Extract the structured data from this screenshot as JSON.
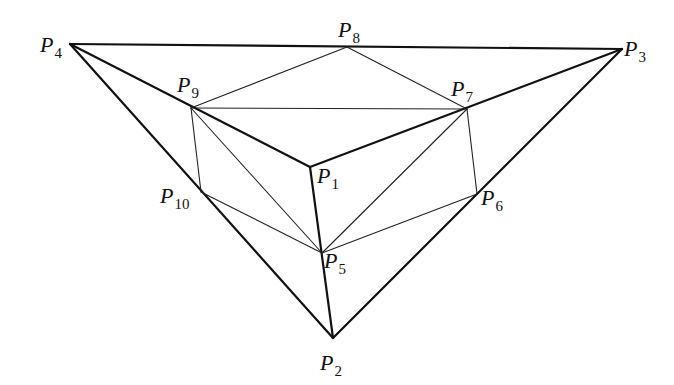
{
  "diagram": {
    "points": [
      {
        "id": "P1",
        "base": "P",
        "sub": "1",
        "x": 310,
        "y": 167,
        "lx": 317,
        "ly": 183
      },
      {
        "id": "P2",
        "base": "P",
        "sub": "2",
        "x": 333,
        "y": 338,
        "lx": 320,
        "ly": 370
      },
      {
        "id": "P3",
        "base": "P",
        "sub": "3",
        "x": 622,
        "y": 49,
        "lx": 624,
        "ly": 56
      },
      {
        "id": "P4",
        "base": "P",
        "sub": "4",
        "x": 70,
        "y": 44,
        "lx": 40,
        "ly": 52
      },
      {
        "id": "P5",
        "base": "P",
        "sub": "5",
        "x": 322,
        "y": 253,
        "lx": 324,
        "ly": 268
      },
      {
        "id": "P6",
        "base": "P",
        "sub": "6",
        "x": 477,
        "y": 194,
        "lx": 481,
        "ly": 205
      },
      {
        "id": "P7",
        "base": "P",
        "sub": "7",
        "x": 467,
        "y": 109,
        "lx": 451,
        "ly": 96
      },
      {
        "id": "P8",
        "base": "P",
        "sub": "8",
        "x": 347,
        "y": 47,
        "lx": 338,
        "ly": 37
      },
      {
        "id": "P9",
        "base": "P",
        "sub": "9",
        "x": 191,
        "y": 108,
        "lx": 177,
        "ly": 92
      },
      {
        "id": "P10",
        "base": "P",
        "sub": "10",
        "x": 201,
        "y": 192,
        "lx": 160,
        "ly": 203
      }
    ],
    "thick_edges": [
      [
        "P4",
        "P3"
      ],
      [
        "P4",
        "P2"
      ],
      [
        "P3",
        "P2"
      ],
      [
        "P4",
        "P1"
      ],
      [
        "P3",
        "P1"
      ],
      [
        "P1",
        "P2"
      ]
    ],
    "thin_edges": [
      [
        "P9",
        "P8"
      ],
      [
        "P8",
        "P7"
      ],
      [
        "P9",
        "P7"
      ],
      [
        "P9",
        "P10"
      ],
      [
        "P10",
        "P5"
      ],
      [
        "P9",
        "P5"
      ],
      [
        "P7",
        "P5"
      ],
      [
        "P7",
        "P6"
      ],
      [
        "P6",
        "P5"
      ]
    ]
  }
}
